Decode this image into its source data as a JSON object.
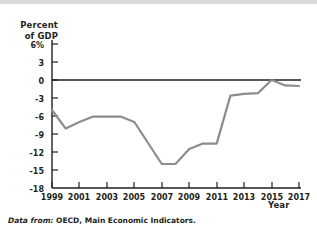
{
  "figure": {
    "caption_lead": "Data from:",
    "caption_source": "OECD, Main Economic Indicators."
  },
  "chart_data": {
    "type": "line",
    "title": "",
    "subtitle": "",
    "xlabel": "Year",
    "ylabel": "Percent of GDP",
    "ylabel_line1": "Percent",
    "ylabel_line2": "of GDP",
    "grid": false,
    "legend": "none",
    "line_color": "#8c8c8c",
    "axis_color": "#231f20",
    "zero_line": 0,
    "xlim": [
      1999,
      2017
    ],
    "ylim": [
      -18,
      6
    ],
    "ytick_labels": [
      "6%",
      "3",
      "0",
      "-3",
      "-6",
      "-9",
      "-12",
      "-15",
      "-18"
    ],
    "yticks": [
      6,
      3,
      0,
      -3,
      -6,
      -9,
      -12,
      -15,
      -18
    ],
    "xtick_labels": [
      "1999",
      "2001",
      "2003",
      "2005",
      "2007",
      "2009",
      "2011",
      "2013",
      "2015",
      "2017"
    ],
    "xticks": [
      1999,
      2001,
      2003,
      2005,
      2007,
      2009,
      2011,
      2013,
      2015,
      2017
    ],
    "series": [
      {
        "name": "Budget deficit as percent of GDP",
        "x": [
          1999,
          2000,
          2001,
          2002,
          2003,
          2004,
          2005,
          2006,
          2007,
          2008,
          2009,
          2010,
          2011,
          2012,
          2013,
          2014,
          2015,
          2016,
          2017
        ],
        "values": [
          -5.0,
          -8.1,
          -7.0,
          -6.1,
          -6.1,
          -6.1,
          -7.0,
          -10.5,
          -14.0,
          -14.0,
          -11.5,
          -10.6,
          -10.6,
          -2.6,
          -2.3,
          -2.2,
          0.0,
          -0.9,
          -1.0
        ]
      }
    ]
  }
}
